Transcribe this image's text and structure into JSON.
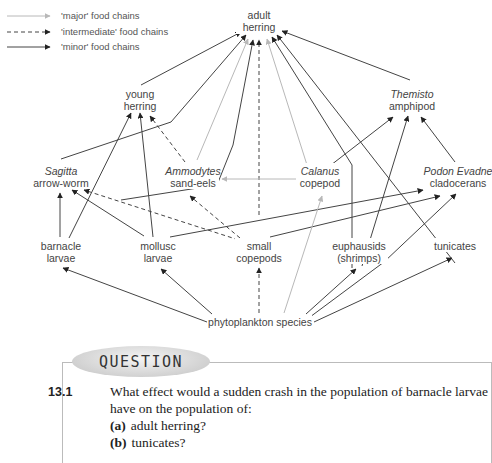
{
  "legend": [
    {
      "style": "major",
      "label": "'major' food chains"
    },
    {
      "style": "intermediate",
      "label": "'intermediate' food chains"
    },
    {
      "style": "minor",
      "label": "'minor' food chains"
    }
  ],
  "nodes": {
    "adult_herring": {
      "line1": "adult",
      "line2": "herring"
    },
    "young_herring": {
      "line1": "young",
      "line2": "herring"
    },
    "themisto": {
      "line1": "Themisto",
      "line2": "amphipod"
    },
    "sagitta": {
      "line1": "Sagitta",
      "line2": "arrow-worm"
    },
    "ammodytes": {
      "line1": "Ammodytes",
      "line2": "sand-eels"
    },
    "calanus": {
      "line1": "Calanus",
      "line2": "copepod"
    },
    "podon": {
      "line1": "Podon Evadne",
      "line2": "cladocerans"
    },
    "barnacle": {
      "line1": "barnacle",
      "line2": "larvae"
    },
    "mollusc": {
      "line1": "mollusc",
      "line2": "larvae"
    },
    "small_copepods": {
      "line1": "small",
      "line2": "copepods"
    },
    "euphausids": {
      "line1": "euphausids",
      "line2": "(shrimps)"
    },
    "tunicates": {
      "line1": "tunicates"
    },
    "phytoplankton": {
      "line1": "phytoplankton species"
    }
  },
  "edges": [
    {
      "from": "young_herring",
      "to": "adult_herring",
      "type": "minor"
    },
    {
      "from": "sagitta",
      "to": "adult_herring",
      "type": "minor"
    },
    {
      "from": "ammodytes",
      "to": "adult_herring",
      "type": "major"
    },
    {
      "from": "mollusc",
      "to": "adult_herring",
      "type": "minor"
    },
    {
      "from": "small_copepods",
      "to": "adult_herring",
      "type": "intermediate"
    },
    {
      "from": "calanus",
      "to": "adult_herring",
      "type": "major"
    },
    {
      "from": "euphausids",
      "to": "adult_herring",
      "type": "minor"
    },
    {
      "from": "tunicates",
      "to": "adult_herring",
      "type": "minor"
    },
    {
      "from": "themisto",
      "to": "adult_herring",
      "type": "minor"
    },
    {
      "from": "barnacle",
      "to": "young_herring",
      "type": "minor"
    },
    {
      "from": "mollusc",
      "to": "young_herring",
      "type": "minor"
    },
    {
      "from": "ammodytes",
      "to": "young_herring",
      "type": "intermediate"
    },
    {
      "from": "barnacle",
      "to": "sagitta",
      "type": "minor"
    },
    {
      "from": "mollusc",
      "to": "sagitta",
      "type": "minor"
    },
    {
      "from": "small_copepods",
      "to": "sagitta",
      "type": "intermediate"
    },
    {
      "from": "small_copepods",
      "to": "ammodytes",
      "type": "intermediate"
    },
    {
      "from": "calanus",
      "to": "ammodytes",
      "type": "major"
    },
    {
      "from": "calanus",
      "to": "themisto",
      "type": "minor"
    },
    {
      "from": "euphausids",
      "to": "themisto",
      "type": "minor"
    },
    {
      "from": "podon",
      "to": "themisto",
      "type": "minor"
    },
    {
      "from": "mollusc",
      "to": "podon",
      "type": "minor"
    },
    {
      "from": "small_copepods",
      "to": "podon",
      "type": "minor"
    },
    {
      "from": "phytoplankton",
      "to": "barnacle",
      "type": "minor"
    },
    {
      "from": "phytoplankton",
      "to": "mollusc",
      "type": "minor"
    },
    {
      "from": "phytoplankton",
      "to": "small_copepods",
      "type": "intermediate"
    },
    {
      "from": "phytoplankton",
      "to": "calanus",
      "type": "major"
    },
    {
      "from": "phytoplankton",
      "to": "euphausids",
      "type": "minor"
    },
    {
      "from": "phytoplankton",
      "to": "podon",
      "type": "minor"
    },
    {
      "from": "phytoplankton",
      "to": "tunicates",
      "type": "minor"
    }
  ],
  "colors": {
    "major": "#b8b8b8",
    "intermediate": "#444444",
    "minor": "#444444"
  },
  "question": {
    "heading": "QUESTION",
    "number": "13.1",
    "text": "What effect would a sudden crash in the population of barnacle larvae have on the population of:",
    "options": [
      {
        "label": "(a)",
        "text": "adult herring?"
      },
      {
        "label": "(b)",
        "text": "tunicates?"
      }
    ]
  }
}
